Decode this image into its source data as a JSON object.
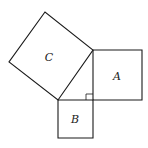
{
  "diagram": {
    "type": "pythagorean-theorem-squares",
    "background": "#ffffff",
    "stroke_color": "#1a1a1a",
    "triangle": {
      "right_angle_vertex": [
        93,
        100
      ],
      "vertices": [
        [
          93,
          50
        ],
        [
          93,
          100
        ],
        [
          58,
          100
        ]
      ]
    },
    "squares": [
      {
        "id": "A",
        "label": "A",
        "side": "vertical leg",
        "points": "93,50 142,50 142,100 93,100",
        "label_pos": [
          117,
          77
        ]
      },
      {
        "id": "B",
        "label": "B",
        "side": "horizontal leg",
        "points": "58,100 93,100 93,138 58,138",
        "label_pos": [
          75,
          120
        ]
      },
      {
        "id": "C",
        "label": "C",
        "side": "hypotenuse",
        "points": "58,100 93,50 45,12 9,62",
        "label_pos": [
          49,
          58
        ]
      }
    ],
    "right_angle_marker": {
      "points": "86,100 86,94 93,94"
    }
  }
}
